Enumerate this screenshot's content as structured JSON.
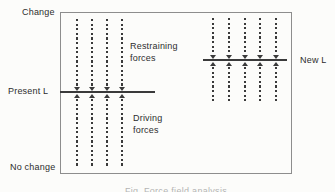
{
  "title_labels": {
    "change": "Change",
    "no_change": "No change",
    "present_level": "Present L",
    "new_level": "New L"
  },
  "zone_labels": {
    "restraining_line1": "Restraining",
    "restraining_line2": "forces",
    "driving_line1": "Driving",
    "driving_line2": "forces"
  },
  "caption": "Fig. Force field analysis",
  "colors": {
    "background": "#fcfcfa",
    "box_border": "#8d8d8d",
    "line": "#3a3a3a",
    "text": "#2d2d2d"
  },
  "diagram": {
    "box": {
      "left": 60,
      "top": 12,
      "width": 232,
      "height": 162
    },
    "force_groups": [
      {
        "name": "restraining-driving-forces",
        "x_positions": [
          77,
          92,
          107,
          122
        ],
        "top": 19,
        "bottom": 168,
        "level_y": 92
      },
      {
        "name": "new-level-forces",
        "x_positions": [
          213,
          229,
          245,
          260,
          276
        ],
        "top": 18,
        "bottom": 103,
        "level_y": 60
      }
    ],
    "level_lines": [
      {
        "name": "present-level-line",
        "x1": 60,
        "x2": 155,
        "y": 92
      },
      {
        "name": "new-level-line",
        "x1": 203,
        "x2": 287,
        "y": 60
      }
    ]
  }
}
